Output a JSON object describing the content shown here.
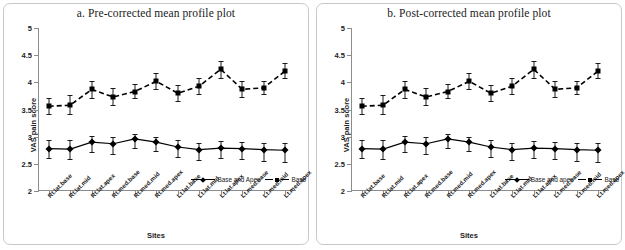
{
  "chart_data": [
    {
      "id": "pre",
      "type": "line",
      "title": "a. Pre-corrected mean profile plot",
      "xlabel": "Sites",
      "ylabel": "VAS pain score",
      "ylim": [
        2,
        5
      ],
      "yticks": [
        "2",
        "2.5",
        "3",
        "3.5",
        "4",
        "4.5",
        "5"
      ],
      "ytick_values": [
        2,
        2.5,
        3,
        3.5,
        4,
        4.5,
        5
      ],
      "grid": false,
      "legend_position": "bottom-right",
      "categories": [
        "Rt.lat.base",
        "Rt.lat.mid",
        "Rt.lat.apex",
        "Rt.med.base",
        "Rt.med.mid",
        "Rt.med.apex",
        "Lt.lat.base",
        "Lt.lat.mid",
        "Lt.lat.apex",
        "Lt.med.base",
        "Lt.med.mid",
        "Lt.med.apex"
      ],
      "series": [
        {
          "name": "Base and Apex",
          "style": "solid",
          "marker": "diamond",
          "values": [
            2.78,
            2.77,
            2.9,
            2.87,
            2.96,
            2.9,
            2.81,
            2.76,
            2.79,
            2.78,
            2.76,
            2.75
          ],
          "err_low": [
            2.6,
            2.58,
            2.72,
            2.68,
            2.8,
            2.73,
            2.62,
            2.57,
            2.6,
            2.58,
            2.56,
            2.54
          ],
          "err_high": [
            2.93,
            2.93,
            3.02,
            3.0,
            3.04,
            3.0,
            2.93,
            2.88,
            2.92,
            2.91,
            2.89,
            2.88
          ]
        },
        {
          "name": "Base",
          "style": "dashed",
          "marker": "square",
          "values": [
            3.56,
            3.58,
            3.87,
            3.73,
            3.83,
            4.02,
            3.8,
            3.93,
            4.24,
            3.87,
            3.9,
            4.21
          ],
          "err_low": [
            3.41,
            3.41,
            3.72,
            3.59,
            3.71,
            3.88,
            3.66,
            3.79,
            4.08,
            3.73,
            3.78,
            4.08
          ],
          "err_high": [
            3.72,
            3.76,
            4.02,
            3.89,
            3.97,
            4.17,
            3.96,
            4.08,
            4.4,
            4.02,
            4.03,
            4.35
          ]
        }
      ]
    },
    {
      "id": "post",
      "type": "line",
      "title": "b. Post-corrected mean profile plot",
      "xlabel": "Sites",
      "ylabel": "VAS pain score",
      "ylim": [
        2,
        5
      ],
      "yticks": [
        "2",
        "2.5",
        "3",
        "3.5",
        "4",
        "4.5",
        "5"
      ],
      "ytick_values": [
        2,
        2.5,
        3,
        3.5,
        4,
        4.5,
        5
      ],
      "grid": false,
      "legend_position": "bottom-right",
      "categories": [
        "Rt.lat.base",
        "Rt.lat.mid",
        "Rt.lat.apex",
        "Rt.med.base",
        "Rt.med.mid",
        "Rt.med.apex",
        "Lt.lat.base",
        "Lt.lat.mid",
        "Lt.lat.apex",
        "Lt.med.base",
        "Lt.med.mid",
        "Lt.med.apex"
      ],
      "series": [
        {
          "name": "Base and apex",
          "style": "solid",
          "marker": "diamond",
          "values": [
            2.78,
            2.77,
            2.9,
            2.87,
            2.96,
            2.9,
            2.81,
            2.76,
            2.79,
            2.78,
            2.76,
            2.75
          ],
          "err_low": [
            2.6,
            2.58,
            2.72,
            2.68,
            2.8,
            2.73,
            2.62,
            2.57,
            2.6,
            2.58,
            2.56,
            2.54
          ],
          "err_high": [
            2.93,
            2.93,
            3.02,
            3.0,
            3.04,
            3.0,
            2.93,
            2.88,
            2.92,
            2.91,
            2.89,
            2.88
          ]
        },
        {
          "name": "Base",
          "style": "dashed",
          "marker": "square",
          "values": [
            3.56,
            3.58,
            3.87,
            3.73,
            3.83,
            4.02,
            3.8,
            3.93,
            4.24,
            3.87,
            3.9,
            4.21
          ],
          "err_low": [
            3.41,
            3.41,
            3.72,
            3.59,
            3.71,
            3.88,
            3.66,
            3.79,
            4.08,
            3.73,
            3.78,
            4.08
          ],
          "err_high": [
            3.72,
            3.76,
            4.02,
            3.89,
            3.97,
            4.17,
            3.96,
            4.08,
            4.4,
            4.02,
            4.03,
            4.35
          ]
        }
      ]
    }
  ],
  "colors": {
    "series_line": "#000000",
    "axis": "#8c8c8c",
    "frame_border": "#c9c9c9",
    "text": "#222222",
    "background": "#ffffff"
  }
}
